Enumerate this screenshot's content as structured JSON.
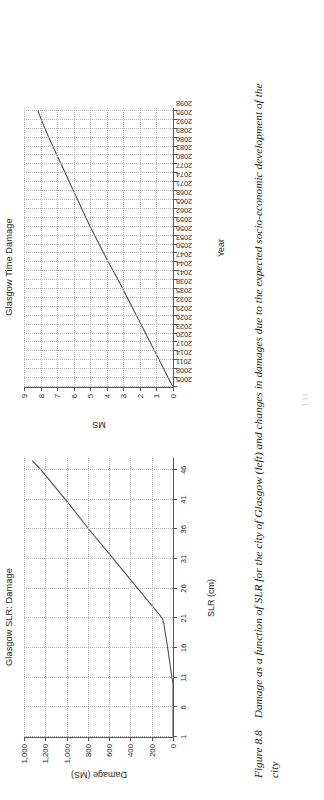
{
  "figure": {
    "caption_number": "Figure 8.8",
    "caption_text": "Damage as a function of SLR for the city of Glasgow (left) and changes in damages due to the expected socio-economic development of the city",
    "page_number": "133"
  },
  "chart_data": [
    {
      "type": "line",
      "title": "Glasgow SLR: Damage",
      "xlabel": "SLR (cm)",
      "ylabel": "Damage (MS)",
      "xticks": [
        1,
        6,
        11,
        16,
        21,
        26,
        31,
        36,
        41,
        46
      ],
      "xticklabels": [
        "1",
        "6",
        "11",
        "16",
        "21",
        "26",
        "31",
        "36",
        "41",
        "46"
      ],
      "yticks": [
        0,
        200,
        400,
        600,
        800,
        1000,
        1200,
        1400
      ],
      "yticklabels": [
        "0",
        "200",
        "400",
        "600",
        "800",
        "1,000",
        "1,200",
        "1,000"
      ],
      "xlim": [
        1,
        48
      ],
      "ylim": [
        0,
        1400
      ],
      "grid": true,
      "legend": "none",
      "x": [
        1,
        6,
        10,
        11,
        16,
        20,
        21,
        26,
        31,
        36,
        41,
        46,
        47.5
      ],
      "values": [
        0,
        0,
        0,
        10,
        50,
        85,
        100,
        330,
        560,
        790,
        1010,
        1240,
        1320
      ]
    },
    {
      "type": "line",
      "title": "Glasgow Time Damage",
      "xlabel": "Year",
      "ylabel": "MS",
      "xticks": [
        2005,
        2008,
        2011,
        2014,
        2017,
        2020,
        2023,
        2026,
        2029,
        2032,
        2035,
        2038,
        2041,
        2044,
        2047,
        2050,
        2053,
        2056,
        2059,
        2062,
        2065,
        2068,
        2071,
        2074,
        2077,
        2080,
        2083,
        2086,
        2089,
        2092,
        2095,
        2098
      ],
      "xticklabels": [
        "2005",
        "2008",
        "2011",
        "2014",
        "2017",
        "2020",
        "2023",
        "2026",
        "2029",
        "2032",
        "2035",
        "2038",
        "2041",
        "2044",
        "2047",
        "2050",
        "2053",
        "2056",
        "2059",
        "2062",
        "2065",
        "2068",
        "2071",
        "2074",
        "2077",
        "2080",
        "2083",
        "2086",
        "2089",
        "2092",
        "2095",
        "2098"
      ],
      "yticks": [
        0,
        1,
        2,
        3,
        4,
        5,
        6,
        7,
        8,
        9
      ],
      "yticklabels": [
        "0",
        "1",
        "2",
        "3",
        "4",
        "5",
        "6",
        "7",
        "8",
        "9"
      ],
      "xlim": [
        2005,
        2099
      ],
      "ylim": [
        0,
        9
      ],
      "grid": true,
      "legend": "none",
      "x": [
        2005,
        2011,
        2017,
        2023,
        2029,
        2035,
        2041,
        2047,
        2053,
        2059,
        2065,
        2071,
        2077,
        2083,
        2089,
        2095,
        2098
      ],
      "values": [
        0,
        0.55,
        1.1,
        1.65,
        2.2,
        2.75,
        3.3,
        3.9,
        4.45,
        5.0,
        5.5,
        6.0,
        6.5,
        7.0,
        7.5,
        7.95,
        8.15
      ]
    }
  ]
}
